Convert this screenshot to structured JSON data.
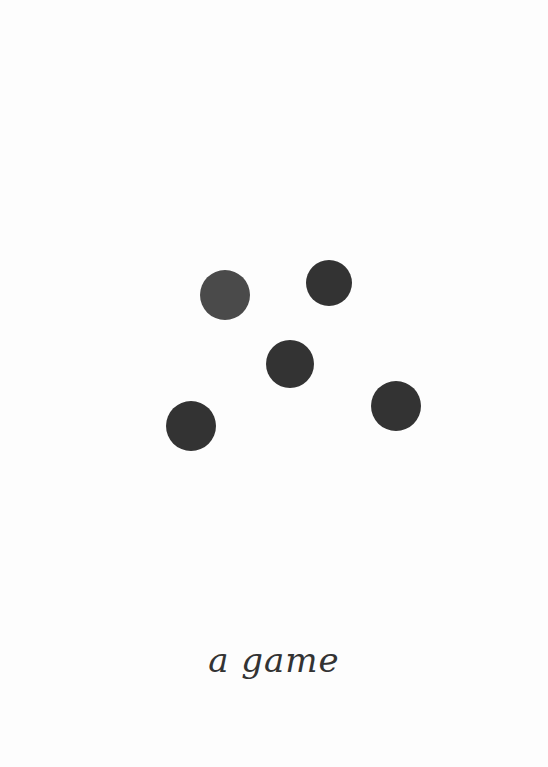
{
  "page": {
    "background": "#fdfdfd"
  },
  "dots": [
    {
      "cx": 225,
      "cy": 295,
      "r": 25,
      "color": "#4a4a4a"
    },
    {
      "cx": 329,
      "cy": 283,
      "r": 23,
      "color": "#333333"
    },
    {
      "cx": 290,
      "cy": 364,
      "r": 24,
      "color": "#333333"
    },
    {
      "cx": 396,
      "cy": 406,
      "r": 25,
      "color": "#333333"
    },
    {
      "cx": 191,
      "cy": 426,
      "r": 25,
      "color": "#333333"
    }
  ],
  "title": {
    "text": "a game"
  }
}
